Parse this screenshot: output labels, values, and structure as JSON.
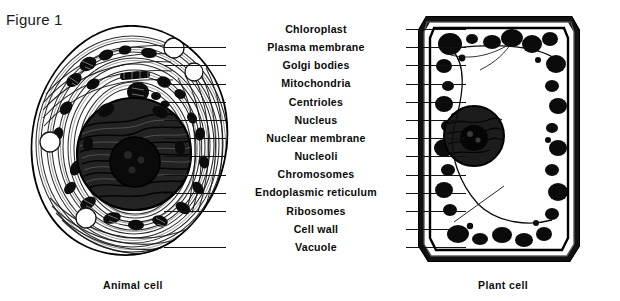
{
  "figure": {
    "title": "Figure 1"
  },
  "captions": {
    "animal": "Animal cell",
    "plant": "Plant cell"
  },
  "labels": [
    {
      "text": "Chloroplast",
      "leader_left": false,
      "leader_right": true
    },
    {
      "text": "Plasma membrane",
      "leader_left": true,
      "leader_right": true
    },
    {
      "text": "Golgi bodies",
      "leader_left": true,
      "leader_right": true
    },
    {
      "text": "Mitochondria",
      "leader_left": true,
      "leader_right": true
    },
    {
      "text": "Centrioles",
      "leader_left": true,
      "leader_right": true
    },
    {
      "text": "Nucleus",
      "leader_left": true,
      "leader_right": true
    },
    {
      "text": "Nuclear membrane",
      "leader_left": true,
      "leader_right": true
    },
    {
      "text": "Nucleoli",
      "leader_left": true,
      "leader_right": true
    },
    {
      "text": "Chromosomes",
      "leader_left": true,
      "leader_right": true
    },
    {
      "text": "Endoplasmic reticulum",
      "leader_left": true,
      "leader_right": true
    },
    {
      "text": "Ribosomes",
      "leader_left": true,
      "leader_right": true
    },
    {
      "text": "Cell wall",
      "leader_left": false,
      "leader_right": true
    },
    {
      "text": "Vacuole",
      "leader_left": true,
      "leader_right": true
    }
  ],
  "colors": {
    "ink": "#111111",
    "paper": "#ffffff",
    "cell_fill": "#2b2b2b"
  },
  "diagram": {
    "animal_cell_name": "animal-cell-micrograph",
    "plant_cell_name": "plant-cell-micrograph"
  }
}
